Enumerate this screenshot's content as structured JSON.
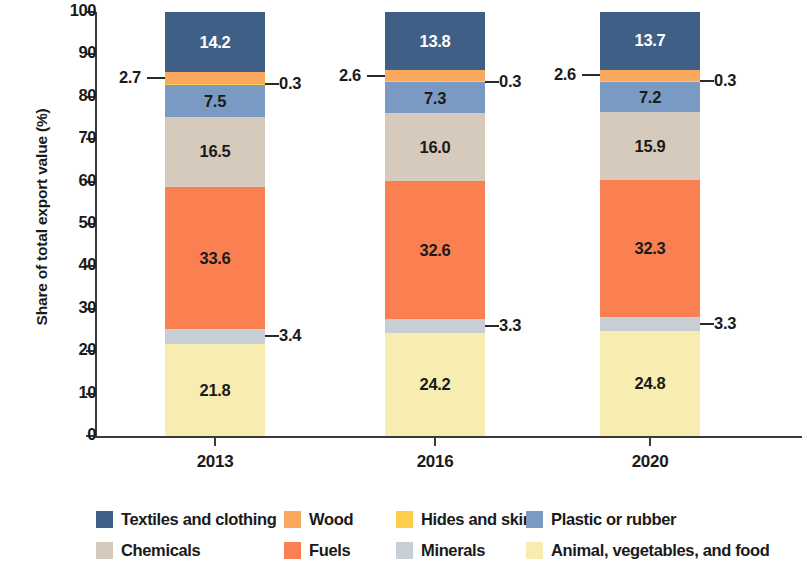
{
  "chart_data": {
    "type": "bar",
    "stacked": true,
    "title": "",
    "xlabel": "",
    "ylabel": "Share of total export value (%)",
    "ylim": [
      0,
      100
    ],
    "yticks": [
      0,
      10,
      20,
      30,
      40,
      50,
      60,
      70,
      80,
      90,
      100
    ],
    "ytick_labels": [
      "0",
      "10",
      "20",
      "30",
      "40",
      "50",
      "60",
      "70",
      "80",
      "90",
      "100"
    ],
    "grid": false,
    "legend_position": "bottom",
    "categories": [
      "2013",
      "2016",
      "2020"
    ],
    "series": [
      {
        "name": "Animal, vegetables, and food",
        "color": "#f8edb0",
        "values": [
          21.8,
          24.2,
          24.8
        ],
        "label_style": "dark",
        "labelled": true
      },
      {
        "name": "Minerals",
        "color": "#c7ced6",
        "values": [
          3.4,
          3.3,
          3.3
        ],
        "label_style": "dark",
        "labelled": false,
        "callout_side": "right"
      },
      {
        "name": "Fuels",
        "color": "#fa8052",
        "values": [
          33.6,
          32.6,
          32.3
        ],
        "label_style": "dark",
        "labelled": true
      },
      {
        "name": "Chemicals",
        "color": "#d5cabb",
        "values": [
          16.5,
          16.0,
          15.9
        ],
        "label_style": "dark",
        "labelled": true
      },
      {
        "name": "Plastic or rubber",
        "color": "#7a9ac4",
        "values": [
          7.5,
          7.3,
          7.2
        ],
        "label_style": "dark",
        "labelled": true
      },
      {
        "name": "Hides and skin",
        "color": "#fbcf4b",
        "values": [
          0.3,
          0.3,
          0.3
        ],
        "label_style": "dark",
        "labelled": false,
        "callout_side": "right"
      },
      {
        "name": "Wood",
        "color": "#f9a85e",
        "values": [
          2.7,
          2.6,
          2.6
        ],
        "label_style": "dark",
        "labelled": false,
        "callout_side": "left"
      },
      {
        "name": "Textiles and clothing",
        "color": "#3f5f87",
        "values": [
          14.2,
          13.8,
          13.7
        ],
        "label_style": "light",
        "labelled": true
      }
    ],
    "legend_entries": [
      {
        "label": "Textiles and clothing",
        "color": "#3f5f87"
      },
      {
        "label": "Wood",
        "color": "#f9a85e"
      },
      {
        "label": "Hides and skin",
        "color": "#fbcf4b"
      },
      {
        "label": "Plastic or rubber",
        "color": "#7a9ac4"
      },
      {
        "label": "Chemicals",
        "color": "#d5cabb"
      },
      {
        "label": "Fuels",
        "color": "#fa8052"
      },
      {
        "label": "Minerals",
        "color": "#c7ced6"
      },
      {
        "label": "Animal, vegetables, and food",
        "color": "#f8edb0"
      }
    ],
    "callouts": [
      {
        "text": "2.7",
        "side": "left",
        "bar": 0,
        "series": "Wood"
      },
      {
        "text": "0.3",
        "side": "right",
        "bar": 0,
        "series": "Hides and skin"
      },
      {
        "text": "3.4",
        "side": "right",
        "bar": 0,
        "series": "Minerals"
      },
      {
        "text": "2.6",
        "side": "left",
        "bar": 1,
        "series": "Wood"
      },
      {
        "text": "0.3",
        "side": "right",
        "bar": 1,
        "series": "Hides and skin"
      },
      {
        "text": "3.3",
        "side": "right",
        "bar": 1,
        "series": "Minerals"
      },
      {
        "text": "2.6",
        "side": "left",
        "bar": 2,
        "series": "Wood"
      },
      {
        "text": "0.3",
        "side": "right",
        "bar": 2,
        "series": "Hides and skin"
      },
      {
        "text": "3.3",
        "side": "right",
        "bar": 2,
        "series": "Minerals"
      }
    ]
  }
}
